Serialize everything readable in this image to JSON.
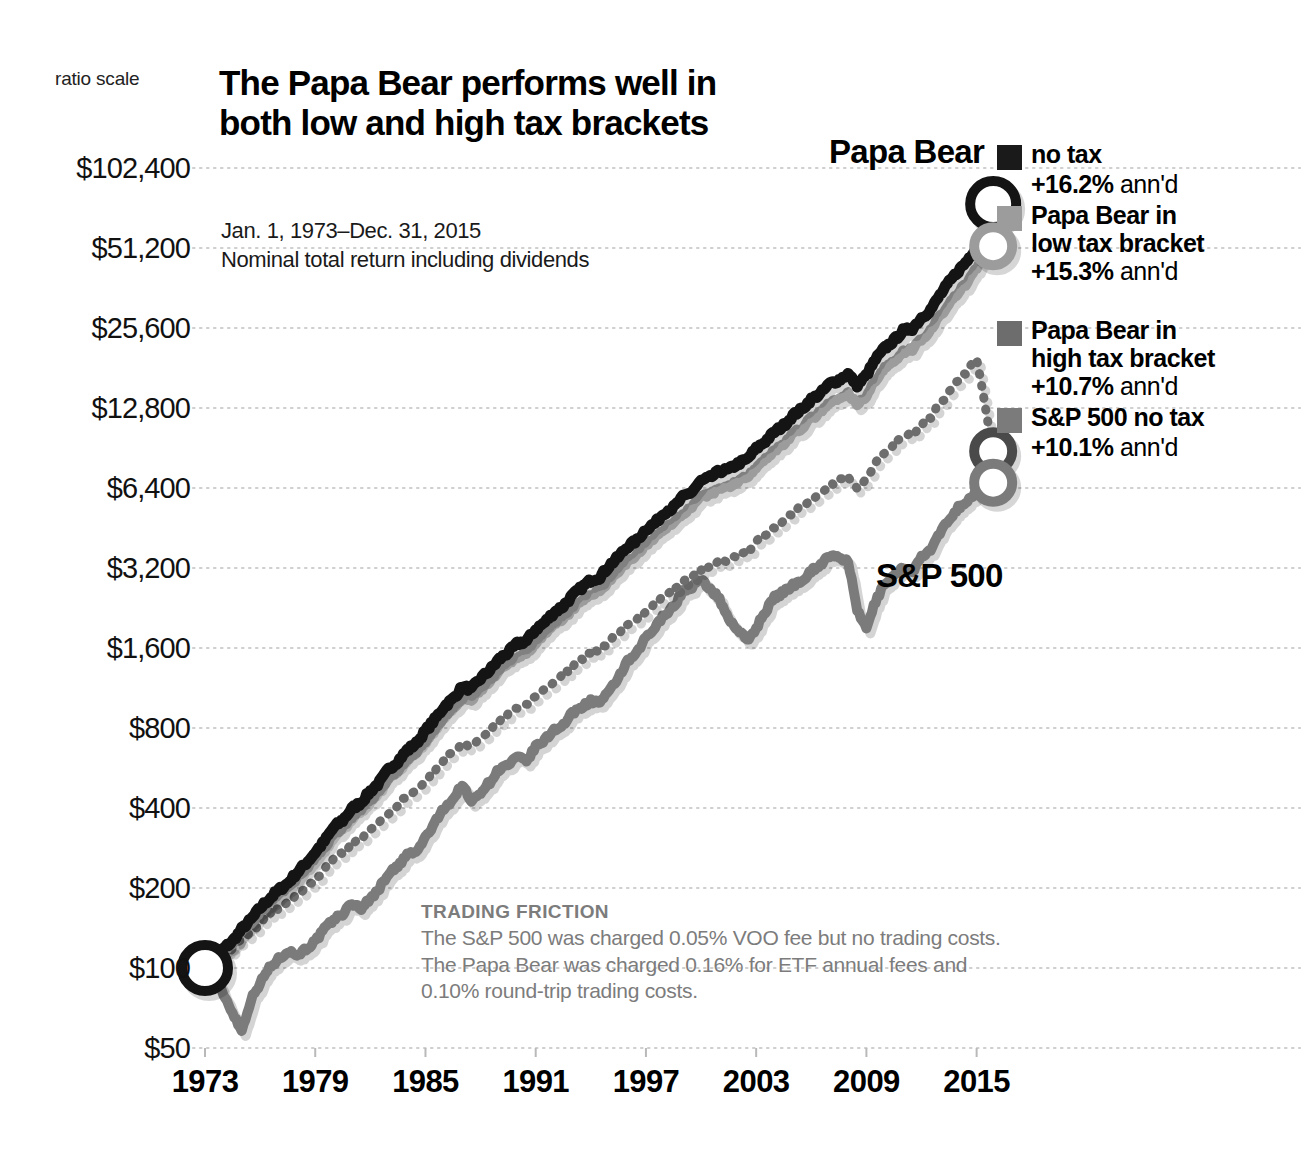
{
  "axis_note": "ratio scale",
  "title": "The Papa Bear performs well in both low and high tax brackets",
  "subtitle_line1": "Jan. 1, 1973–Dec. 31, 2015",
  "subtitle_line2": "Nominal total return including dividends",
  "series_tags": {
    "papa_bear": "Papa Bear",
    "sp500": "S&P 500"
  },
  "legend": {
    "items": [
      {
        "label_line1": "no tax",
        "label_line2": "",
        "pct": "+16.2%",
        "annd": " ann'd",
        "color": "#1a1a1a"
      },
      {
        "label_line1": "Papa Bear in",
        "label_line2": "low tax bracket",
        "pct": "+15.3%",
        "annd": " ann'd",
        "color": "#9c9c9c"
      },
      {
        "label_line1": "Papa Bear in",
        "label_line2": "high tax bracket",
        "pct": "+10.7%",
        "annd": " ann'd",
        "color": "#6d6d6d"
      },
      {
        "label_line1": "S&P 500 no tax",
        "label_line2": "",
        "pct": "+10.1%",
        "annd": " ann'd",
        "color": "#7b7b7b"
      }
    ]
  },
  "friction": {
    "heading": "TRADING FRICTION",
    "body": "The S&P 500 was charged 0.05% VOO fee but no trading costs. The Papa Bear was charged 0.16% for ETF annual fees and 0.10% round-trip trading costs."
  },
  "chart_data": {
    "type": "line",
    "title": "The Papa Bear performs well in both low and high tax brackets",
    "subtitle": "Jan. 1, 1973–Dec. 31, 2015 — Nominal total return including dividends",
    "xlabel": "",
    "ylabel": "",
    "scale": "log2 (ratio scale)",
    "grid": true,
    "legend_position": "right",
    "ylim": [
      50,
      102400
    ],
    "yticks": [
      50,
      100,
      200,
      400,
      800,
      1600,
      3200,
      6400,
      12800,
      25600,
      51200,
      102400
    ],
    "ytick_labels": [
      "$50",
      "$100",
      "$200",
      "$400",
      "$800",
      "$1,600",
      "$3,200",
      "$6,400",
      "$12,800",
      "$25,600",
      "$51,200",
      "$102,400"
    ],
    "xlim": [
      1973,
      2016
    ],
    "xticks": [
      1973,
      1979,
      1985,
      1991,
      1997,
      2003,
      2009,
      2015
    ],
    "xtick_labels": [
      "1973",
      "1979",
      "1985",
      "1991",
      "1997",
      "2003",
      "2009",
      "2015"
    ],
    "x": [
      1973,
      1973.5,
      1974,
      1974.5,
      1975,
      1975.5,
      1976,
      1976.5,
      1977,
      1977.5,
      1978,
      1978.5,
      1979,
      1979.5,
      1980,
      1980.5,
      1981,
      1981.5,
      1982,
      1982.5,
      1983,
      1983.5,
      1984,
      1984.5,
      1985,
      1985.5,
      1986,
      1986.5,
      1987,
      1987.5,
      1988,
      1988.5,
      1989,
      1989.5,
      1990,
      1990.5,
      1991,
      1991.5,
      1992,
      1992.5,
      1993,
      1993.5,
      1994,
      1994.5,
      1995,
      1995.5,
      1996,
      1996.5,
      1997,
      1997.5,
      1998,
      1998.5,
      1999,
      1999.5,
      2000,
      2000.5,
      2001,
      2001.5,
      2002,
      2002.5,
      2003,
      2003.5,
      2004,
      2004.5,
      2005,
      2005.5,
      2006,
      2006.5,
      2007,
      2007.5,
      2008,
      2008.5,
      2009,
      2009.5,
      2010,
      2010.5,
      2011,
      2011.5,
      2012,
      2012.5,
      2013,
      2013.5,
      2014,
      2014.5,
      2015,
      2015.9
    ],
    "series": [
      {
        "name": "Papa Bear no tax",
        "annualized_return": 16.2,
        "style": "solid",
        "color": "#141414",
        "values": [
          100,
          108,
          118,
          126,
          140,
          152,
          168,
          182,
          196,
          208,
          228,
          248,
          272,
          300,
          338,
          360,
          398,
          420,
          462,
          500,
          560,
          600,
          660,
          700,
          780,
          860,
          960,
          1030,
          1140,
          1120,
          1230,
          1320,
          1450,
          1540,
          1660,
          1700,
          1880,
          2000,
          2180,
          2300,
          2520,
          2700,
          2880,
          2960,
          3260,
          3520,
          3860,
          4060,
          4480,
          4720,
          5180,
          5400,
          5900,
          6200,
          6800,
          7000,
          7400,
          7500,
          7900,
          8200,
          9000,
          9600,
          10400,
          11000,
          12000,
          12700,
          13800,
          14500,
          15800,
          16300,
          17200,
          15600,
          17000,
          19500,
          21500,
          23000,
          25000,
          25500,
          28000,
          30000,
          34000,
          38000,
          42000,
          46000,
          52000,
          75000
        ]
      },
      {
        "name": "Papa Bear in low tax bracket",
        "annualized_return": 15.3,
        "style": "solid",
        "color": "#9c9c9c",
        "values": [
          100,
          107,
          116,
          124,
          137,
          148,
          163,
          176,
          189,
          200,
          218,
          236,
          258,
          284,
          318,
          338,
          372,
          392,
          430,
          464,
          518,
          554,
          608,
          644,
          716,
          788,
          876,
          938,
          1036,
          1016,
          1114,
          1192,
          1306,
          1384,
          1490,
          1524,
          1680,
          1786,
          1944,
          2048,
          2240,
          2396,
          2552,
          2620,
          2880,
          3104,
          3396,
          3568,
          3928,
          4132,
          4524,
          4712,
          5136,
          5388,
          5896,
          6064,
          6396,
          6472,
          6800,
          7044,
          7720,
          8216,
          8884,
          9384,
          10212,
          10792,
          11704,
          12276,
          13356,
          13756,
          14496,
          13128,
          14284,
          16352,
          18000,
          19236,
          20880,
          21276,
          23344,
          24972,
          28268,
          31552,
          34852,
          38136,
          43080,
          52000
        ]
      },
      {
        "name": "Papa Bear in high tax bracket",
        "annualized_return": 10.7,
        "style": "dotted",
        "color": "#6d6d6d",
        "values": [
          100,
          105,
          112,
          118,
          128,
          137,
          148,
          158,
          167,
          175,
          188,
          201,
          216,
          235,
          259,
          272,
          294,
          307,
          331,
          352,
          386,
          409,
          443,
          464,
          509,
          554,
          608,
          644,
          703,
          685,
          741,
          785,
          851,
          893,
          952,
          968,
          1056,
          1113,
          1199,
          1253,
          1358,
          1440,
          1522,
          1551,
          1690,
          1806,
          1957,
          2039,
          2222,
          2317,
          2514,
          2601,
          2812,
          2929,
          3176,
          3248,
          3402,
          3431,
          3580,
          3689,
          4011,
          4243,
          4558,
          4788,
          5179,
          5444,
          5867,
          6118,
          6616,
          6785,
          7114,
          6419,
          6951,
          7919,
          8678,
          9236,
          9980,
          10139,
          11068,
          11789,
          13302,
          14771,
          16253,
          17682,
          19880,
          8800
        ]
      },
      {
        "name": "S&P 500 no tax",
        "annualized_return": 10.1,
        "style": "solid",
        "color": "#7b7b7b",
        "values": [
          100,
          92,
          80,
          68,
          58,
          76,
          88,
          100,
          108,
          116,
          112,
          118,
          126,
          140,
          152,
          160,
          175,
          168,
          182,
          200,
          228,
          240,
          268,
          272,
          310,
          350,
          400,
          430,
          490,
          420,
          460,
          500,
          560,
          580,
          620,
          600,
          680,
          720,
          790,
          820,
          910,
          960,
          1010,
          1000,
          1090,
          1240,
          1420,
          1520,
          1760,
          1900,
          2150,
          2280,
          2620,
          2720,
          2880,
          2680,
          2440,
          2060,
          1880,
          1700,
          1900,
          2200,
          2480,
          2600,
          2760,
          2880,
          3120,
          3300,
          3560,
          3480,
          3420,
          2200,
          1900,
          2400,
          2800,
          3000,
          3200,
          3100,
          3500,
          3750,
          4300,
          4900,
          5400,
          5700,
          6200,
          6700
        ]
      }
    ],
    "markers": [
      {
        "label": "start",
        "x": 1973,
        "y": 100,
        "type": "ring",
        "color": "#141414"
      },
      {
        "label": "Papa Bear no tax end",
        "x": 2015.9,
        "y": 75000,
        "type": "ring",
        "color": "#141414"
      },
      {
        "label": "Papa Bear low tax end",
        "x": 2015.9,
        "y": 52000,
        "type": "ring",
        "color": "#9c9c9c"
      },
      {
        "label": "Papa Bear high tax end",
        "x": 2015.9,
        "y": 8800,
        "type": "ring",
        "color": "#4a4a4a"
      },
      {
        "label": "S&P 500 end",
        "x": 2015.9,
        "y": 6700,
        "type": "ring",
        "color": "#7b7b7b"
      }
    ]
  }
}
